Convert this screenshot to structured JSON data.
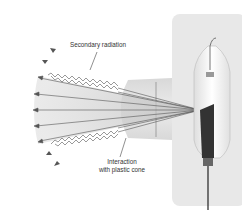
{
  "diagram": {
    "labels": {
      "secondary_radiation": "Secondary radiation",
      "interaction_line1": "Interaction",
      "interaction_line2": "with plastic cone"
    },
    "components": [
      "housing-panel",
      "glass-tube",
      "anode",
      "cathode-filament",
      "plastic-cone",
      "primary-beam-arrows",
      "secondary-radiation-wavy-arrows"
    ],
    "colors": {
      "panel": "#e6e6e6",
      "cone": "#d9d9d9",
      "beam": "#c8c8c8",
      "lines": "#555555",
      "text": "#333333"
    }
  }
}
